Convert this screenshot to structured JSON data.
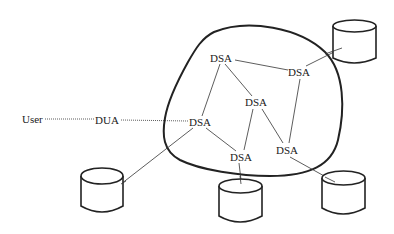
{
  "diagram": {
    "type": "directory-system-network",
    "labels": {
      "user": "User",
      "dua": "DUA",
      "dsa1": "DSA",
      "dsa2": "DSA",
      "dsa3": "DSA",
      "dsa4": "DSA",
      "dsa5": "DSA",
      "dsa6": "DSA"
    },
    "nodes": [
      {
        "id": "user",
        "label": "User",
        "x": 33,
        "y": 119
      },
      {
        "id": "dua",
        "label": "DUA",
        "x": 108,
        "y": 120
      },
      {
        "id": "dsa1",
        "label": "DSA",
        "x": 222,
        "y": 58
      },
      {
        "id": "dsa2",
        "label": "DSA",
        "x": 301,
        "y": 72
      },
      {
        "id": "dsa3",
        "label": "DSA",
        "x": 257,
        "y": 102
      },
      {
        "id": "dsa4",
        "label": "DSA",
        "x": 201,
        "y": 122
      },
      {
        "id": "dsa5",
        "label": "DSA",
        "x": 241,
        "y": 157
      },
      {
        "id": "dsa6",
        "label": "DSA",
        "x": 287,
        "y": 150
      }
    ],
    "databases": [
      {
        "id": "db-top-right",
        "x": 333,
        "y": 20,
        "w": 43,
        "h": 42
      },
      {
        "id": "db-bottom-left",
        "x": 80,
        "y": 166,
        "w": 43,
        "h": 46
      },
      {
        "id": "db-bottom-middle",
        "x": 219,
        "y": 178,
        "w": 43,
        "h": 44
      },
      {
        "id": "db-bottom-right",
        "x": 322,
        "y": 170,
        "w": 43,
        "h": 44
      }
    ],
    "edges": [
      {
        "from": "user",
        "to": "dua",
        "style": "dotted"
      },
      {
        "from": "dua",
        "to": "dsa4",
        "style": "dotted"
      },
      {
        "from": "dsa1",
        "to": "dsa2",
        "style": "solid"
      },
      {
        "from": "dsa1",
        "to": "dsa3",
        "style": "solid"
      },
      {
        "from": "dsa1",
        "to": "dsa4",
        "style": "solid"
      },
      {
        "from": "dsa2",
        "to": "dsa6",
        "style": "solid"
      },
      {
        "from": "dsa2",
        "to": "db-top-right",
        "style": "solid"
      },
      {
        "from": "dsa3",
        "to": "dsa5",
        "style": "solid"
      },
      {
        "from": "dsa3",
        "to": "dsa6",
        "style": "solid"
      },
      {
        "from": "dsa4",
        "to": "dsa5",
        "style": "solid"
      },
      {
        "from": "dsa4",
        "to": "db-bottom-left",
        "style": "solid"
      },
      {
        "from": "dsa5",
        "to": "db-bottom-middle",
        "style": "solid"
      },
      {
        "from": "dsa6",
        "to": "db-bottom-right",
        "style": "solid"
      }
    ],
    "colors": {
      "stroke": "#222222",
      "background": "#ffffff"
    }
  }
}
